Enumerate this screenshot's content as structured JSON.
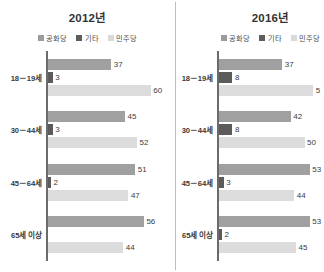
{
  "figure": {
    "divider": true
  },
  "legend": {
    "items": [
      {
        "label": "공화당",
        "key": "rep",
        "color": "#9c9c9c"
      },
      {
        "label": "기타",
        "key": "oth",
        "color": "#5e5e5e"
      },
      {
        "label": "민주당",
        "key": "dem",
        "color": "#d9d9d9"
      }
    ]
  },
  "panels": [
    {
      "title": "2012년",
      "categories": [
        "18－19세",
        "30－44세",
        "45－64세",
        "65세 이상"
      ],
      "groups": [
        {
          "rep": "37",
          "oth": "3",
          "dem": "60"
        },
        {
          "rep": "45",
          "oth": "3",
          "dem": "52"
        },
        {
          "rep": "51",
          "oth": "2",
          "dem": "47"
        },
        {
          "rep": "56",
          "oth": "",
          "dem": "44"
        }
      ]
    },
    {
      "title": "2016년",
      "categories": [
        "18－19세",
        "30－44세",
        "45－64세",
        "65세 이상"
      ],
      "groups": [
        {
          "rep": "37",
          "oth": "8",
          "dem": "5"
        },
        {
          "rep": "42",
          "oth": "8",
          "dem": "50"
        },
        {
          "rep": "53",
          "oth": "3",
          "dem": "44"
        },
        {
          "rep": "53",
          "oth": "2",
          "dem": "45"
        }
      ]
    }
  ],
  "chart_data": {
    "type": "bar",
    "orientation": "horizontal",
    "title": "",
    "xlabel": "",
    "ylabel": "",
    "grid": false,
    "legend_position": "top-center",
    "xlim": [
      0,
      62
    ],
    "categories": [
      "18－19세",
      "30－44세",
      "45－64세",
      "65세 이상"
    ],
    "panels": [
      {
        "title": "2012년",
        "series": [
          {
            "name": "공화당",
            "values": [
              37,
              45,
              51,
              56
            ]
          },
          {
            "name": "기타",
            "values": [
              3,
              3,
              2,
              null
            ]
          },
          {
            "name": "민주당",
            "values": [
              60,
              52,
              47,
              44
            ]
          }
        ]
      },
      {
        "title": "2016년",
        "series": [
          {
            "name": "공화당",
            "values": [
              37,
              42,
              53,
              53
            ]
          },
          {
            "name": "기타",
            "values": [
              8,
              8,
              3,
              2
            ]
          },
          {
            "name": "민주당",
            "values": [
              55,
              50,
              44,
              45
            ]
          }
        ],
        "notes": "18－19세 민주당 bar extends past the right edge; its data label is clipped to '5'."
      }
    ]
  }
}
